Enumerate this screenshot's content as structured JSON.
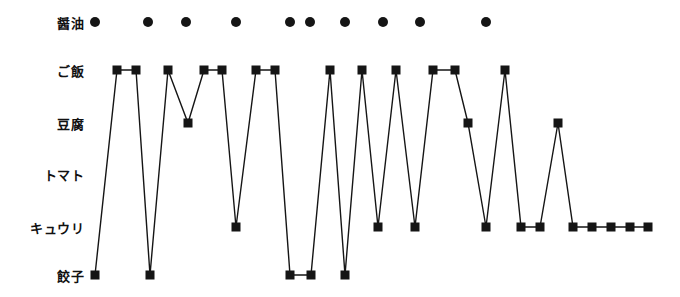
{
  "chart_data": {
    "type": "line",
    "title": "",
    "xlabel": "",
    "ylabel": "",
    "grid": false,
    "legend": null,
    "orientation": "categorical-y-vs-sequence-x",
    "y_categories": [
      "醤油",
      "ご飯",
      "豆腐",
      "トマト",
      "キュウリ",
      "餃子"
    ],
    "y_category_labels": {
      "shoyu": "醤油",
      "gohan": "ご飯",
      "tofu": "豆腐",
      "tomato": "トマト",
      "kyuuri": "キュウリ",
      "gyoza": "餃子"
    },
    "series": [
      {
        "name": "醤油",
        "marker": "circle",
        "connected": false,
        "color": "#151515",
        "points": [
          {
            "x": 95,
            "y": "醤油"
          },
          {
            "x": 148,
            "y": "醤油"
          },
          {
            "x": 186,
            "y": "醤油"
          },
          {
            "x": 236,
            "y": "醤油"
          },
          {
            "x": 290,
            "y": "醤油"
          },
          {
            "x": 310,
            "y": "醤油"
          },
          {
            "x": 345,
            "y": "醤油"
          },
          {
            "x": 383,
            "y": "醤油"
          },
          {
            "x": 420,
            "y": "醤油"
          },
          {
            "x": 486,
            "y": "醤油"
          }
        ]
      },
      {
        "name": "食べ順",
        "marker": "square",
        "connected": true,
        "color": "#151515",
        "points": [
          {
            "x": 95,
            "y": "餃子"
          },
          {
            "x": 117,
            "y": "ご飯"
          },
          {
            "x": 136,
            "y": "ご飯"
          },
          {
            "x": 150,
            "y": "餃子"
          },
          {
            "x": 168,
            "y": "ご飯"
          },
          {
            "x": 188,
            "y": "豆腐"
          },
          {
            "x": 204,
            "y": "ご飯"
          },
          {
            "x": 222,
            "y": "ご飯"
          },
          {
            "x": 236,
            "y": "キュウリ"
          },
          {
            "x": 256,
            "y": "ご飯"
          },
          {
            "x": 275,
            "y": "ご飯"
          },
          {
            "x": 290,
            "y": "餃子"
          },
          {
            "x": 311,
            "y": "餃子"
          },
          {
            "x": 330,
            "y": "ご飯"
          },
          {
            "x": 345,
            "y": "餃子"
          },
          {
            "x": 362,
            "y": "ご飯"
          },
          {
            "x": 378,
            "y": "キュウリ"
          },
          {
            "x": 396,
            "y": "ご飯"
          },
          {
            "x": 415,
            "y": "キュウリ"
          },
          {
            "x": 433,
            "y": "ご飯"
          },
          {
            "x": 455,
            "y": "ご飯"
          },
          {
            "x": 468,
            "y": "豆腐"
          },
          {
            "x": 486,
            "y": "キュウリ"
          },
          {
            "x": 505,
            "y": "ご飯"
          },
          {
            "x": 521,
            "y": "キュウリ"
          },
          {
            "x": 540,
            "y": "キュウリ"
          },
          {
            "x": 558,
            "y": "豆腐"
          },
          {
            "x": 573,
            "y": "キュウリ"
          },
          {
            "x": 592,
            "y": "キュウリ"
          },
          {
            "x": 611,
            "y": "キュウリ"
          },
          {
            "x": 630,
            "y": "キュウリ"
          },
          {
            "x": 648,
            "y": "キュウリ"
          }
        ]
      }
    ],
    "row_pixel_y": {
      "醤油": 22,
      "ご飯": 70,
      "豆腐": 123,
      "トマト": 174,
      "キュウリ": 227,
      "餃子": 275
    },
    "xlim": [
      84,
      680
    ]
  },
  "style": {
    "line_color": "#151515",
    "marker_color": "#151515",
    "background": "#ffffff",
    "square_size": 9,
    "circle_radius": 5,
    "line_width": 1.4
  }
}
